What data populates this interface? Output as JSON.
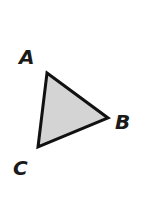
{
  "diagram": {
    "type": "triangle",
    "fill": "#d4d4d4",
    "stroke": "#111111",
    "vertices": [
      {
        "label": "A",
        "x": 47,
        "y": 73,
        "label_x": 19,
        "label_y": 64
      },
      {
        "label": "B",
        "x": 108,
        "y": 118,
        "label_x": 115,
        "label_y": 129
      },
      {
        "label": "C",
        "x": 38,
        "y": 147,
        "label_x": 13,
        "label_y": 175
      }
    ]
  }
}
